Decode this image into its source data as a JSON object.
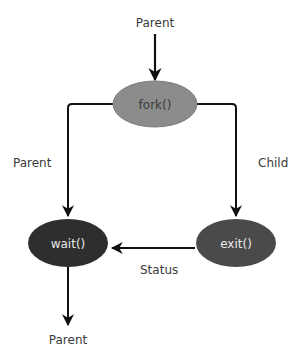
{
  "diagram": {
    "nodes": [
      {
        "id": "fork",
        "label": "fork()",
        "fill": "#8c8c8c"
      },
      {
        "id": "wait",
        "label": "wait()",
        "fill": "#2e2e2e"
      },
      {
        "id": "exit",
        "label": "exit()",
        "fill": "#4a4a4a"
      }
    ],
    "edges": [
      {
        "from": "start",
        "to": "fork",
        "label": "Parent"
      },
      {
        "from": "fork",
        "to": "wait",
        "label": "Parent"
      },
      {
        "from": "fork",
        "to": "exit",
        "label": "Child"
      },
      {
        "from": "exit",
        "to": "wait",
        "label": "Status"
      },
      {
        "from": "wait",
        "to": "end",
        "label": "Parent"
      }
    ],
    "colors": {
      "line": "#111111",
      "text": "#3a3a3a",
      "light_text": "#e8e8e8"
    }
  }
}
